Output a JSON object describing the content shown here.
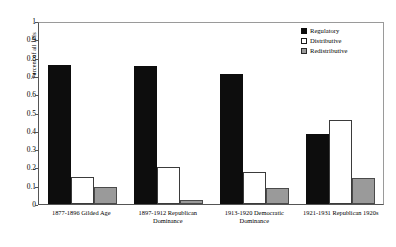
{
  "chart_data": {
    "type": "bar",
    "title": "",
    "xlabel": "",
    "ylabel": "Percent of all IPIs",
    "ylim": [
      0,
      1
    ],
    "yticks": [
      "0",
      "0.1",
      "0.2",
      "0.3",
      "0.4",
      "0.5",
      "0.6",
      "0.7",
      "0.8",
      "0.9",
      "1"
    ],
    "grid": false,
    "legend_position": "top-right",
    "categories": [
      "1877-1896 Gilded Age",
      "1897-1912 Republican Dominance",
      "1913-1920 Democratic Dominance",
      "1921-1931 Republican 1920s"
    ],
    "series": [
      {
        "name": "Regulatory",
        "color": "#0d0d0d",
        "values": [
          0.76,
          0.755,
          0.71,
          0.38
        ]
      },
      {
        "name": "Distributive",
        "color": "#ffffff",
        "values": [
          0.145,
          0.2,
          0.175,
          0.46
        ]
      },
      {
        "name": "Redistributive",
        "color": "#9a9a9a",
        "values": [
          0.095,
          0.02,
          0.085,
          0.14
        ]
      }
    ]
  }
}
